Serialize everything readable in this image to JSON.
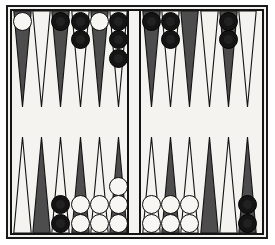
{
  "board": {
    "game": "Backgammon",
    "surface_color": "#f4f3f0",
    "frame_color": "#141414",
    "point_dark_color": "#4d4d4d",
    "point_light_color": "#f4f3f0",
    "point_outline_color": "#141414",
    "checker_white_color": "#f7f6f3",
    "checker_black_color": "#141414",
    "bar_label": "bar",
    "quadrants": [
      {
        "name": "top-left",
        "points": [
          {
            "index": 1,
            "shade": "dark",
            "checkers": 1,
            "color": "white"
          },
          {
            "index": 2,
            "shade": "light",
            "checkers": 0,
            "color": "none"
          },
          {
            "index": 3,
            "shade": "dark",
            "checkers": 1,
            "color": "black"
          },
          {
            "index": 4,
            "shade": "light",
            "checkers": 2,
            "color": "black"
          },
          {
            "index": 5,
            "shade": "dark",
            "checkers": 1,
            "color": "white"
          },
          {
            "index": 6,
            "shade": "light",
            "checkers": 3,
            "color": "black"
          }
        ]
      },
      {
        "name": "top-right",
        "points": [
          {
            "index": 7,
            "shade": "dark",
            "checkers": 1,
            "color": "black"
          },
          {
            "index": 8,
            "shade": "light",
            "checkers": 2,
            "color": "black"
          },
          {
            "index": 9,
            "shade": "dark",
            "checkers": 0,
            "color": "none"
          },
          {
            "index": 10,
            "shade": "light",
            "checkers": 0,
            "color": "none"
          },
          {
            "index": 11,
            "shade": "dark",
            "checkers": 2,
            "color": "black"
          },
          {
            "index": 12,
            "shade": "light",
            "checkers": 0,
            "color": "none"
          }
        ]
      },
      {
        "name": "bottom-left",
        "points": [
          {
            "index": 13,
            "shade": "light",
            "checkers": 0,
            "color": "none"
          },
          {
            "index": 14,
            "shade": "dark",
            "checkers": 0,
            "color": "none"
          },
          {
            "index": 15,
            "shade": "light",
            "checkers": 2,
            "color": "black"
          },
          {
            "index": 16,
            "shade": "dark",
            "checkers": 2,
            "color": "white"
          },
          {
            "index": 17,
            "shade": "light",
            "checkers": 2,
            "color": "white"
          },
          {
            "index": 18,
            "shade": "dark",
            "checkers": 3,
            "color": "white"
          }
        ]
      },
      {
        "name": "bottom-right",
        "points": [
          {
            "index": 19,
            "shade": "light",
            "checkers": 2,
            "color": "white"
          },
          {
            "index": 20,
            "shade": "dark",
            "checkers": 2,
            "color": "white"
          },
          {
            "index": 21,
            "shade": "light",
            "checkers": 2,
            "color": "white"
          },
          {
            "index": 22,
            "shade": "dark",
            "checkers": 0,
            "color": "none"
          },
          {
            "index": 23,
            "shade": "light",
            "checkers": 0,
            "color": "none"
          },
          {
            "index": 24,
            "shade": "dark",
            "checkers": 2,
            "color": "black"
          }
        ]
      }
    ]
  }
}
